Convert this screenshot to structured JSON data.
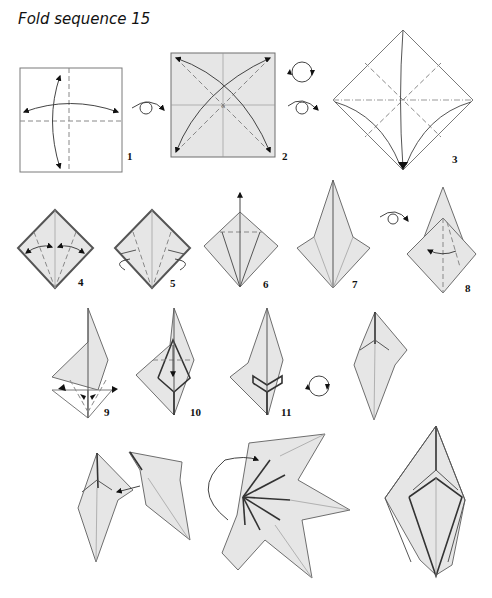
{
  "title": "Fold sequence 15",
  "steps": [
    {
      "number": "1",
      "description": "Valley-fold square in half both ways and unfold"
    },
    {
      "number": "2",
      "description": "Turn over; valley-fold diagonals and unfold"
    },
    {
      "number": "3",
      "description": "Collapse into preliminary base"
    },
    {
      "number": "4",
      "description": "Fold edges to center crease and unfold"
    },
    {
      "number": "5",
      "description": "Inside reverse-fold"
    },
    {
      "number": "6",
      "description": "Petal fold upward"
    },
    {
      "number": "7",
      "description": "Result"
    },
    {
      "number": "8",
      "description": "Turn over and repeat"
    },
    {
      "number": "9",
      "description": "Fold flaps"
    },
    {
      "number": "10",
      "description": "Fold down"
    },
    {
      "number": "11",
      "description": "Result, rotate"
    },
    {
      "number": "12",
      "description": "Unit complete"
    },
    {
      "number": "13",
      "description": "Join units"
    },
    {
      "number": "14",
      "description": "Assemble flower"
    },
    {
      "number": "15",
      "description": "Finished model"
    }
  ],
  "symbols": {
    "turn_over": "turn-over-icon",
    "rotate": "rotate-icon"
  },
  "colors": {
    "paper": "#e6e6e6",
    "line": "#555555",
    "background": "#ffffff"
  }
}
